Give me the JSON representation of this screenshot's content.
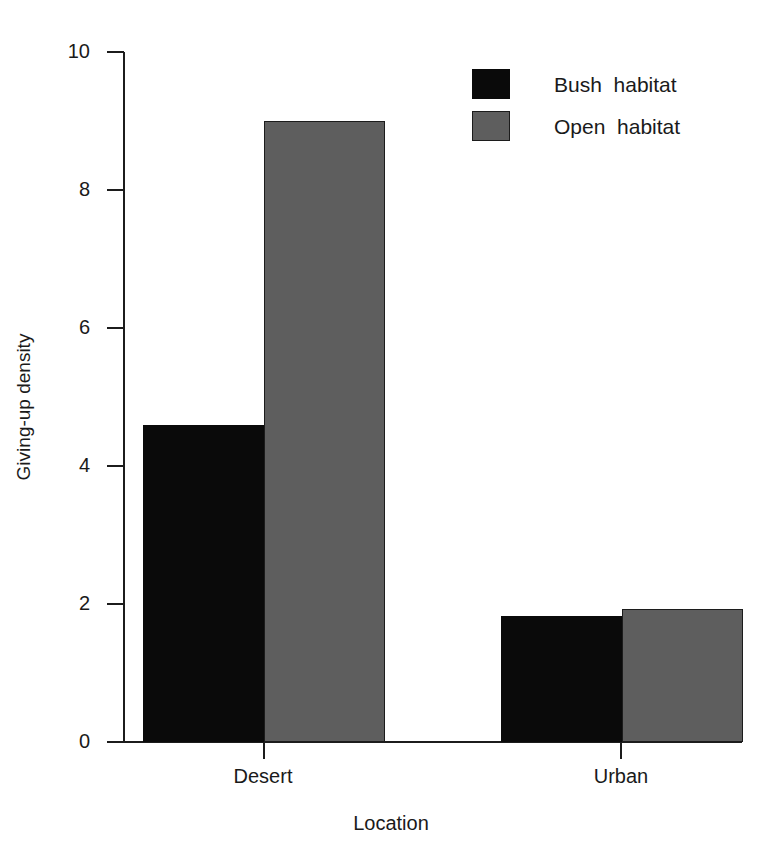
{
  "chart_data": {
    "type": "bar",
    "title": "",
    "subtitle": "",
    "xlabel": "Location",
    "ylabel": "Giving-up density",
    "categories": [
      "Desert",
      "Urban"
    ],
    "series": [
      {
        "name": "Bush  habitat",
        "color": "#0a0a0a",
        "values": [
          4.6,
          1.83
        ]
      },
      {
        "name": "Open  habitat",
        "color": "#5e5e5e",
        "values": [
          9.0,
          1.93
        ]
      }
    ],
    "ylim": [
      0,
      10
    ],
    "yticks": [
      0,
      2,
      4,
      6,
      8,
      10
    ],
    "ytick_labels": [
      "0",
      "2",
      "4",
      "6",
      "8",
      "10"
    ],
    "grid": false,
    "legend_position": "top-right",
    "legend_entries": [
      "Bush  habitat",
      "Open  habitat"
    ]
  },
  "axes": {
    "y_title": "Giving-up density",
    "x_title": "Location",
    "y_tick_labels": [
      "10",
      "8",
      "6",
      "4",
      "2",
      "0"
    ],
    "x_tick_labels": [
      "Desert",
      "Urban"
    ]
  },
  "legend": {
    "items": [
      {
        "label": "Bush  habitat",
        "swatch": "#0a0a0a"
      },
      {
        "label": "Open  habitat",
        "swatch": "#5e5e5e"
      }
    ]
  }
}
